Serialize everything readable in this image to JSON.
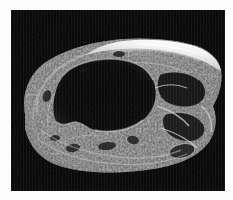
{
  "figure": {
    "domain": "natural-image",
    "modality": "grayscale sectional photograph",
    "caption": "",
    "orientation": "landscape",
    "canvas": {
      "width_px": 233,
      "height_px": 200,
      "background_color": "#fdfdfd"
    },
    "plate": {
      "left_px": 11,
      "top_px": 10,
      "width_px": 214,
      "height_px": 181,
      "background_color": "#010101"
    },
    "palette": {
      "page_background": "#fdfdfd",
      "plate_background": "#010101",
      "cavity_black": "#050505",
      "tissue_dark": "#2a2a2a",
      "tissue_mid": "#6e6e6e",
      "tissue_light": "#b4b4b4",
      "highlight_white": "#f2f2f2"
    },
    "features": [
      {
        "name": "central-cavity",
        "label": "central cavity",
        "description": "large irregular black lumen occupying the left-of-centre region",
        "tone": "black"
      },
      {
        "name": "cortical-wall",
        "label": "cortical wall",
        "description": "thick bright textured rim enclosing the central cavity",
        "tone": "light grey"
      },
      {
        "name": "bright-ridge",
        "label": "bright dorsal ridge",
        "description": "near-white band running along the upper right margin of the specimen",
        "tone": "white"
      },
      {
        "name": "internal-chambers",
        "label": "internal chambers",
        "description": "cluster of small dark voids and bright septa in the right third",
        "tone": "mixed"
      },
      {
        "name": "ventral-margin",
        "label": "ventral margin",
        "description": "smooth lower boundary of the specimen against the black field",
        "tone": "mid grey"
      }
    ],
    "annotations": [],
    "scale_bar": null,
    "labels": []
  }
}
